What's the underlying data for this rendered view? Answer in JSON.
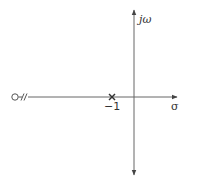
{
  "diagram": {
    "type": "s-plane pole-zero plot",
    "axes": {
      "horizontal_label": "σ",
      "vertical_label": "jω"
    },
    "poles": [
      {
        "label": "−1",
        "real": -1,
        "imag": 0,
        "marker": "×"
      }
    ],
    "zeros_at_infinity": [
      {
        "marker": "o with break",
        "symbol": "O//",
        "position": "left end of real axis"
      }
    ],
    "colors": {
      "axis": "#555555",
      "text": "#333333",
      "background": "#ffffff"
    }
  }
}
